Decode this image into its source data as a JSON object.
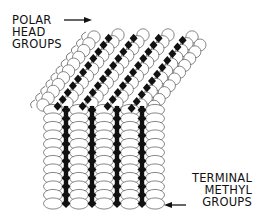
{
  "figure": {
    "type": "diagram",
    "colors": {
      "background": "#ffffff",
      "ink": "#111111",
      "outline": "#555555"
    }
  },
  "labels": {
    "polar_head": {
      "lines": [
        "POLAR",
        "HEAD",
        "GROUPS"
      ],
      "arrow_direction": "right"
    },
    "terminal_methyl": {
      "lines": [
        "TERMINAL",
        "METHYL",
        "GROUPS"
      ],
      "arrow_direction": "left"
    }
  },
  "structure": {
    "vertical_chains": 4,
    "tilted_chains": 5,
    "vertical_spine_x": [
      66,
      92,
      117,
      142
    ],
    "vertical_top_y": 110,
    "vertical_bottom_y": 204,
    "bump_spacing": 8.5
  }
}
